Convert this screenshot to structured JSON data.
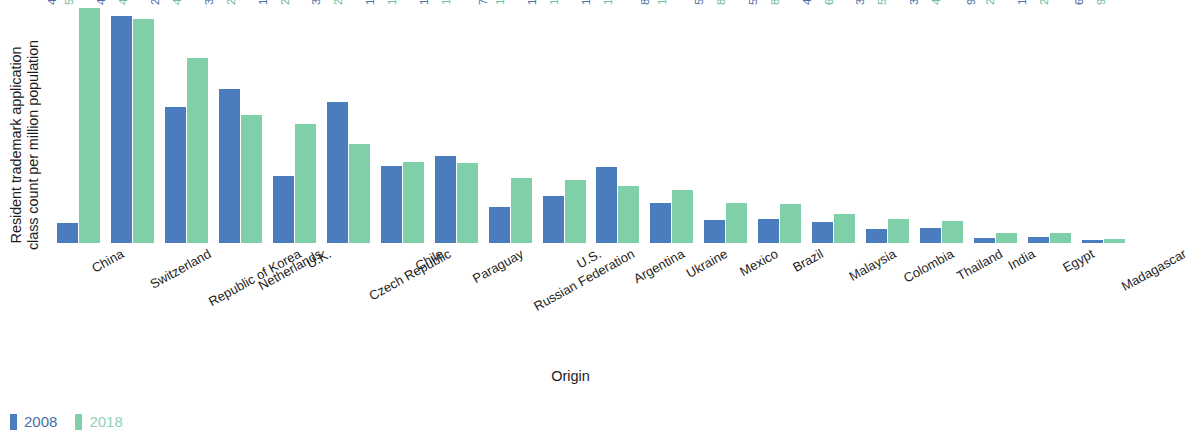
{
  "chart_data": {
    "type": "bar",
    "title": "",
    "xlabel": "Origin",
    "ylabel": "Resident trademark application\nclass count per million population",
    "ylim": [
      0,
      5117
    ],
    "grid": false,
    "legend_position": "bottom-left",
    "categories": [
      "China",
      "Switzerland",
      "Republic of Korea",
      "Netherlands",
      "U.K.",
      "Czech Republic",
      "Chile",
      "Paraguay",
      "Russian Federation",
      "U.S.",
      "Argentina",
      "Ukraine",
      "Mexico",
      "Brazil",
      "Malaysia",
      "Colombia",
      "Thailand",
      "India",
      "Egypt",
      "Madagascar"
    ],
    "series": [
      {
        "name": "2008",
        "color": "#4b7cbe",
        "values": [
          446,
          4936,
          2954,
          3347,
          1450,
          3068,
          1684,
          1895,
          790,
          1016,
          1655,
          879,
          511,
          519,
          461,
          314,
          330,
          99,
          128,
          67
        ],
        "labels": [
          "446",
          "4,936",
          "2,954",
          "3,347",
          "1,450",
          "3,068",
          "1,684",
          "1,895",
          "790",
          "1,016",
          "1,655",
          "879",
          "511",
          "519",
          "461",
          "314",
          "330",
          "99",
          "128",
          "67"
        ]
      },
      {
        "name": "2018",
        "color": "#7fcfa8",
        "values": [
          5117,
          4869,
          4027,
          2795,
          2600,
          2165,
          1757,
          1737,
          1411,
          1363,
          1247,
          1147,
          867,
          841,
          630,
          522,
          473,
          220,
          215,
          93
        ],
        "labels": [
          "5,117",
          "4,869",
          "4,027",
          "2,795",
          "2,600",
          "2,165",
          "1,757",
          "1,737",
          "1,411",
          "1,363",
          "1,247",
          "1,147",
          "867",
          "841",
          "630",
          "522",
          "473",
          "220",
          "215",
          "93"
        ]
      }
    ]
  },
  "legend": [
    {
      "label": "2008",
      "key": "s2008"
    },
    {
      "label": "2018",
      "key": "s2018"
    }
  ]
}
